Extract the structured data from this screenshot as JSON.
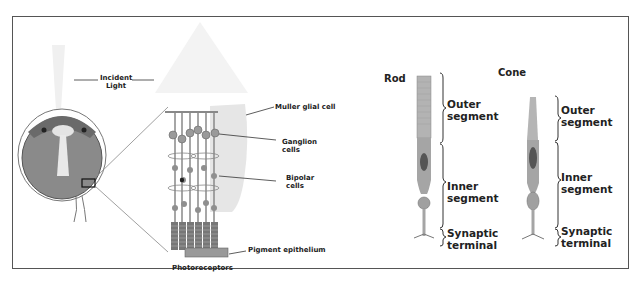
{
  "diagram": {
    "eye_panel": {
      "labels": {
        "incident_light": "Incident\nLight",
        "incident_light_line1": "Incident",
        "incident_light_line2": "Light"
      }
    },
    "retina_panel": {
      "labels": {
        "muller": "Muller glial cell",
        "ganglion_line1": "Ganglion",
        "ganglion_line2": "cells",
        "bipolar_line1": "Bipolar",
        "bipolar_line2": "cells",
        "pigment": "Pigment epithelium",
        "photoreceptors": "Photoreceptors"
      }
    },
    "photoreceptor_panel": {
      "rod": {
        "title": "Rod",
        "outer_line1": "Outer",
        "outer_line2": "segment",
        "inner_line1": "Inner",
        "inner_line2": "segment",
        "synaptic_line1": "Synaptic",
        "synaptic_line2": "terminal"
      },
      "cone": {
        "title": "Cone",
        "outer_line1": "Outer",
        "outer_line2": "segment",
        "inner_line1": "Inner",
        "inner_line2": "segment",
        "synaptic_line1": "Synaptic",
        "synaptic_line2": "terminal"
      }
    },
    "colors": {
      "frame": "#555555",
      "cell_fill": "#a9a9a9",
      "cell_dark": "#6f6f6f",
      "glia": "#e6e6e6",
      "light_cone": "#f2f2f2",
      "text": "#222222"
    }
  }
}
